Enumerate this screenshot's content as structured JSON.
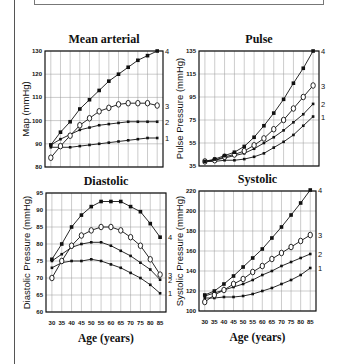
{
  "page": {
    "x_axis_label": "Age (years)"
  },
  "chart_data": [
    {
      "type": "line",
      "title": "Mean arterial",
      "xlabel": "",
      "ylabel": "Map (mmHg)",
      "x": [
        30,
        35,
        40,
        45,
        50,
        55,
        60,
        65,
        70,
        75,
        80,
        85
      ],
      "xlim": [
        27,
        88
      ],
      "ylim": [
        80,
        130
      ],
      "yticks": [
        80,
        90,
        100,
        110,
        120,
        130
      ],
      "grid": true,
      "plot": {
        "left": 45,
        "top": 51,
        "right": 163,
        "bottom": 167
      },
      "series": [
        {
          "name": "1",
          "marker": "filled-small",
          "values": [
            88.5,
            88.5,
            88.5,
            89,
            89.5,
            90,
            90.5,
            91,
            91.5,
            92,
            92.5,
            92.5
          ]
        },
        {
          "name": "2",
          "marker": "filled-small",
          "values": [
            89.5,
            92,
            94,
            96,
            97,
            98,
            98.5,
            99,
            99.5,
            99.5,
            99.5,
            99.5
          ]
        },
        {
          "name": "3",
          "marker": "open-circle",
          "values": [
            84,
            89,
            93.5,
            98,
            101,
            104,
            105.5,
            107,
            107.5,
            107.5,
            107.5,
            106.5
          ]
        },
        {
          "name": "4",
          "marker": "filled-square",
          "values": [
            89.5,
            95,
            99.5,
            105,
            109,
            113,
            117,
            120,
            123,
            126,
            128,
            130
          ]
        }
      ]
    },
    {
      "type": "line",
      "title": "Pulse",
      "xlabel": "",
      "ylabel": "Pulse Pressure (mmHg)",
      "x": [
        30,
        35,
        40,
        45,
        50,
        55,
        60,
        65,
        70,
        75,
        80,
        85
      ],
      "xlim": [
        27,
        88
      ],
      "ylim": [
        35,
        135
      ],
      "yticks": [
        35,
        55,
        75,
        95,
        115,
        135
      ],
      "grid": true,
      "plot": {
        "left": 199,
        "top": 51,
        "right": 319,
        "bottom": 166
      },
      "series": [
        {
          "name": "1",
          "marker": "filled-small",
          "values": [
            39,
            39,
            40,
            40,
            41,
            43,
            46,
            51,
            56,
            62,
            70,
            78
          ]
        },
        {
          "name": "2",
          "marker": "filled-small",
          "values": [
            39,
            40,
            42,
            44,
            46,
            50,
            55,
            60,
            66,
            73,
            80,
            89
          ]
        },
        {
          "name": "3",
          "marker": "open-circle",
          "values": [
            39,
            40,
            43,
            45,
            48,
            53,
            59,
            67,
            75,
            85,
            95,
            105
          ]
        },
        {
          "name": "4",
          "marker": "filled-square",
          "values": [
            39,
            41,
            44,
            47,
            52,
            60,
            70,
            81,
            93,
            107,
            120,
            135
          ]
        }
      ]
    },
    {
      "type": "line",
      "title": "Diastolic",
      "xlabel": "Age (years)",
      "ylabel": "Diastolic Pressure (mmHg)",
      "x": [
        30,
        35,
        40,
        45,
        50,
        55,
        60,
        65,
        70,
        75,
        80,
        85
      ],
      "xlim": [
        27,
        88
      ],
      "ylim": [
        60,
        95
      ],
      "yticks": [
        60,
        65,
        70,
        75,
        80,
        85,
        90,
        95
      ],
      "xticks": [
        30,
        35,
        40,
        45,
        50,
        55,
        60,
        65,
        70,
        75,
        80,
        85
      ],
      "grid": true,
      "plot": {
        "left": 46,
        "top": 193,
        "right": 166,
        "bottom": 312
      },
      "series": [
        {
          "name": "1",
          "marker": "filled-small",
          "values": [
            73,
            74.5,
            75,
            75,
            75.5,
            75,
            74,
            73,
            71.5,
            70,
            68,
            65.5
          ]
        },
        {
          "name": "2",
          "marker": "filled-small",
          "values": [
            75,
            77,
            79,
            80,
            80.5,
            80.5,
            79.5,
            78,
            76.5,
            74.5,
            72.5,
            69.5
          ]
        },
        {
          "name": "3",
          "marker": "open-circle",
          "values": [
            70,
            75,
            79.5,
            82.5,
            84,
            85,
            85,
            84,
            82,
            79.5,
            75.5,
            71
          ]
        },
        {
          "name": "4",
          "marker": "filled-square",
          "values": [
            75.5,
            80,
            85,
            88.5,
            91,
            92.5,
            92.5,
            92.5,
            91,
            89.5,
            86,
            82
          ]
        }
      ]
    },
    {
      "type": "line",
      "title": "Systolic",
      "xlabel": "Age (years)",
      "ylabel": "Systolic Pressure (mmHg)",
      "x": [
        30,
        35,
        40,
        45,
        50,
        55,
        60,
        65,
        70,
        75,
        80,
        85
      ],
      "xlim": [
        27,
        88
      ],
      "ylim": [
        100,
        220
      ],
      "yticks": [
        100,
        120,
        140,
        160,
        180,
        200,
        220
      ],
      "xticks": [
        30,
        35,
        40,
        45,
        50,
        55,
        60,
        65,
        70,
        75,
        80,
        85
      ],
      "grid": true,
      "plot": {
        "left": 199,
        "top": 191,
        "right": 316,
        "bottom": 311
      },
      "series": [
        {
          "name": "1",
          "marker": "filled-small",
          "values": [
            113,
            113,
            114,
            114,
            115,
            117,
            120,
            123,
            127,
            131,
            136,
            143
          ]
        },
        {
          "name": "2",
          "marker": "filled-small",
          "values": [
            115,
            118,
            121,
            124,
            127,
            131,
            136,
            140,
            145,
            149,
            153,
            157
          ]
        },
        {
          "name": "3",
          "marker": "open-circle",
          "values": [
            109,
            116,
            121,
            127,
            132,
            139,
            145,
            152,
            158,
            164,
            170,
            176
          ]
        },
        {
          "name": "4",
          "marker": "filled-square",
          "values": [
            116,
            120,
            127,
            135,
            144,
            153,
            162,
            173,
            184,
            196,
            208,
            221
          ]
        }
      ]
    }
  ]
}
